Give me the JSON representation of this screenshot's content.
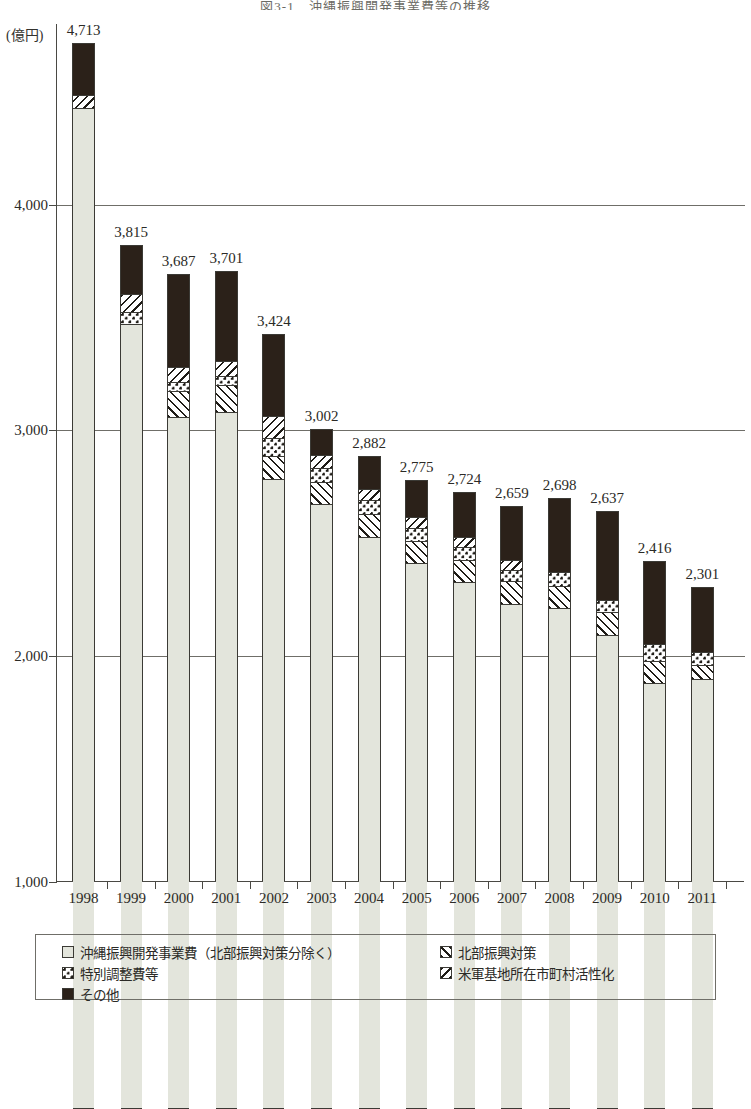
{
  "figure": {
    "title": "図3-1　沖縄振興開発事業費等の推移",
    "y_unit": "(億円)"
  },
  "legend": {
    "items": [
      {
        "label": "沖縄振興開発事業費（北部振興対策分除く）",
        "pattern": "light-solid",
        "key": "base"
      },
      {
        "label": "北部振興対策",
        "pattern": "forward-slash-hatch",
        "key": "hokubu"
      },
      {
        "label": "特別調整費等",
        "pattern": "checker",
        "key": "chousei"
      },
      {
        "label": "米軍基地所在市町村活性化",
        "pattern": "back-slash-hatch",
        "key": "beigun"
      },
      {
        "label": "その他",
        "pattern": "solid-dark",
        "key": "sonota"
      }
    ]
  },
  "chart_data": {
    "type": "bar",
    "stacked": true,
    "title": "図3-1　沖縄振興開発事業費等の推移",
    "xlabel": "",
    "ylabel": "(億円)",
    "ylim": [
      1000,
      4800
    ],
    "yticks": [
      1000,
      2000,
      3000,
      4000
    ],
    "ytick_labels": [
      "1,000",
      "2,000",
      "3,000",
      "4,000"
    ],
    "grid": "horizontal",
    "legend_position": "bottom",
    "categories": [
      "1998",
      "1999",
      "2000",
      "2001",
      "2002",
      "2003",
      "2004",
      "2005",
      "2006",
      "2007",
      "2008",
      "2009",
      "2010",
      "2011"
    ],
    "totals": [
      4713,
      3815,
      3687,
      3701,
      3424,
      3002,
      2882,
      2775,
      2724,
      2659,
      2698,
      2637,
      2416,
      2301
    ],
    "total_labels": [
      "4,713",
      "3,815",
      "3,687",
      "3,701",
      "3,424",
      "3,002",
      "2,882",
      "2,775",
      "2,724",
      "2,659",
      "2,698",
      "2,637",
      "2,416",
      "2,301"
    ],
    "series": [
      {
        "name": "沖縄振興開発事業費（北部振興対策分除く）",
        "key": "base",
        "values": [
          4427,
          3470,
          3059,
          3083,
          2783,
          2672,
          2530,
          2412,
          2327,
          2231,
          2212,
          2094,
          1881,
          1900
        ]
      },
      {
        "name": "北部振興対策",
        "key": "hokubu",
        "values": [
          0,
          0,
          117,
          117,
          105,
          100,
          100,
          100,
          100,
          100,
          100,
          100,
          100,
          60
        ]
      },
      {
        "name": "特別調整費等",
        "key": "chousei",
        "values": [
          0,
          55,
          40,
          40,
          77,
          60,
          60,
          58,
          55,
          53,
          60,
          55,
          75,
          60
        ]
      },
      {
        "name": "米軍基地所在市町村活性化",
        "key": "beigun",
        "values": [
          60,
          80,
          66,
          66,
          99,
          60,
          50,
          45,
          45,
          40,
          0,
          0,
          0,
          0
        ]
      },
      {
        "name": "その他",
        "key": "sonota",
        "values": [
          226,
          210,
          405,
          395,
          360,
          110,
          142,
          160,
          197,
          235,
          326,
          388,
          360,
          281
        ]
      }
    ]
  }
}
